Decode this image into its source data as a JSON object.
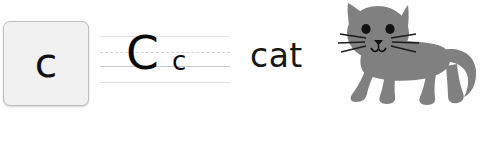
{
  "worksheet": {
    "letter_tile": {
      "glyph": "c",
      "fill_color": "#f1f1f1",
      "border_color": "#bdbdbd",
      "text_color": "#101010"
    },
    "practice_lines": {
      "uppercase": "C",
      "lowercase": "c",
      "rules": [
        {
          "name": "top",
          "style": "faint",
          "color": "#e3e3e3"
        },
        {
          "name": "midline",
          "style": "dashed",
          "color": "#d5d5d5"
        },
        {
          "name": "baseline",
          "style": "solid",
          "color": "#c9c9c9"
        },
        {
          "name": "descender",
          "style": "faint",
          "color": "#e3e3e3"
        }
      ]
    },
    "word": "cat",
    "illustration": {
      "name": "cat-illustration",
      "subject": "cat",
      "body_color": "#808080",
      "eye_color": "#111111",
      "whisker_color": "#1a1a1a",
      "background_color": "#ffffff"
    }
  }
}
